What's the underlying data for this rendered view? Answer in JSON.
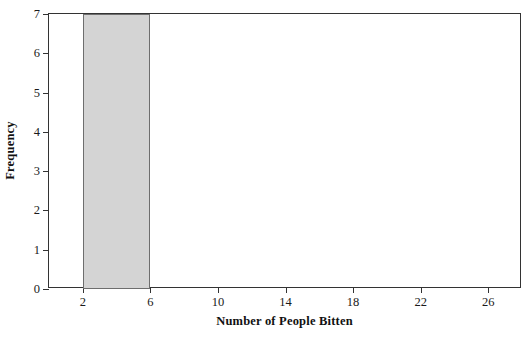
{
  "chart_data": {
    "type": "bar",
    "title": "",
    "xlabel": "Number of People Bitten",
    "ylabel": "Frequency",
    "xlim": [
      0,
      28
    ],
    "ylim": [
      0,
      7
    ],
    "xticks": [
      2,
      6,
      10,
      14,
      18,
      22,
      26
    ],
    "yticks": [
      0,
      1,
      2,
      3,
      4,
      5,
      6,
      7
    ],
    "grid": false,
    "legend": null,
    "bin_width": 4,
    "bins": [
      {
        "start": 2,
        "end": 6,
        "value": 7
      }
    ],
    "categories": [
      "2-6"
    ],
    "values": [
      7
    ],
    "colors": {
      "bar_fill": "#d4d4d4",
      "bar_border": "#6e6e6e",
      "frame": "#333333",
      "text": "#1a1a1a",
      "background": "#ffffff"
    }
  },
  "axes": {
    "x_tick_labels": [
      "2",
      "6",
      "10",
      "14",
      "18",
      "22",
      "26"
    ],
    "y_tick_labels": [
      "0",
      "1",
      "2",
      "3",
      "4",
      "5",
      "6",
      "7"
    ],
    "x_title": "Number of People Bitten",
    "y_title": "Frequency"
  },
  "title": {
    "text": ""
  }
}
